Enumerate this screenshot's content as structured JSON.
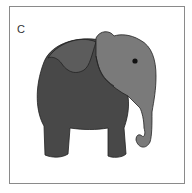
{
  "panel": {
    "label": "C",
    "subject": "elephant-illustration",
    "colors": {
      "border": "#8a8a8a",
      "body": "#484848",
      "ear_back": "#5c5c5c",
      "head": "#7a7a7a",
      "outline": "#222222",
      "eye": "#111111",
      "background": "#ffffff"
    }
  }
}
